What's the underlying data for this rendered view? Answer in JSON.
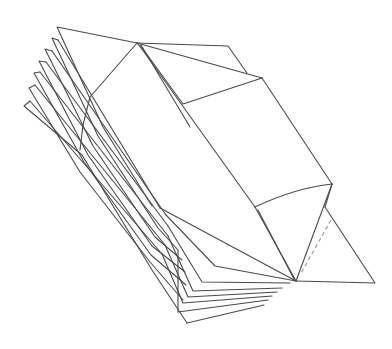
{
  "diagram": {
    "type": "line-drawing",
    "stroke_color": "#4a4a4a",
    "dashed_stroke_color": "#9a9a9a",
    "background": "#ffffff",
    "top_fan_layers": 7,
    "bottom_fan_layers": 7,
    "has_dashed_fold_line": true
  }
}
